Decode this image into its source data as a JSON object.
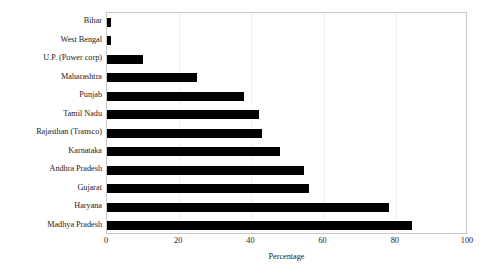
{
  "chart_data": {
    "type": "bar",
    "orientation": "horizontal",
    "title": "",
    "xlabel": "Percentage",
    "ylabel": "",
    "xlim": [
      0,
      100
    ],
    "xticks": [
      0,
      20,
      40,
      60,
      80,
      100
    ],
    "grid": true,
    "grid_axis": "x",
    "legend": false,
    "bar_color": "#000000",
    "frame_color": "#c8c8c8",
    "categories": [
      "Bihar",
      "West Bengal",
      "U.P. (Power corp)",
      "Maharashtra",
      "Punjab",
      "Tamil Nadu",
      "Rajasthan (Transco)",
      "Karnataka",
      "Andhra Pradesh",
      "Gujarat",
      "Haryana",
      "Madhya Pradesh"
    ],
    "values": [
      1,
      1,
      10,
      25,
      38,
      42,
      43,
      48,
      54.5,
      56,
      78,
      84.5
    ]
  }
}
